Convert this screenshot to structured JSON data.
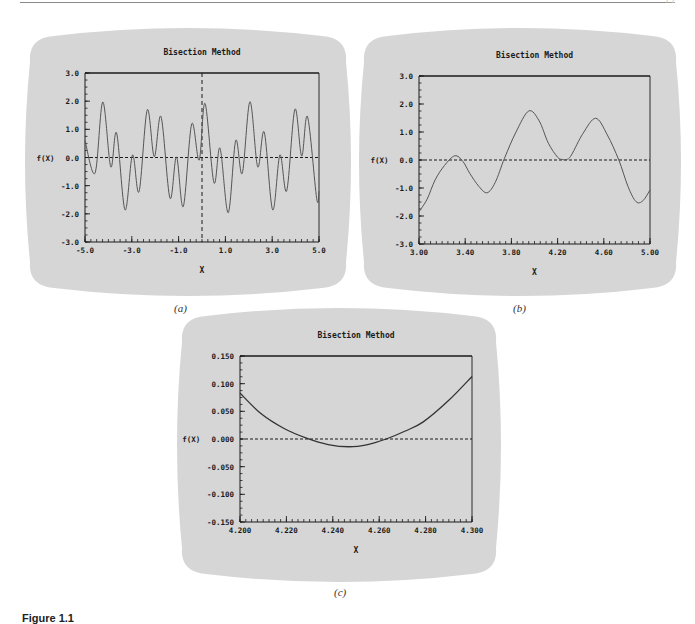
{
  "page": {
    "page_number": "1.2",
    "figure_caption": "Figure 1.1",
    "panel_labels": [
      "(a)",
      "(b)",
      "(c)"
    ]
  },
  "chart_data": [
    {
      "id": "a",
      "type": "line",
      "title": "Bisection Method",
      "xlabel": "X",
      "ylabel": "f(X)",
      "xlim": [
        -5.0,
        5.0
      ],
      "ylim": [
        -3.0,
        3.0
      ],
      "xticks": [
        -5.0,
        -3.0,
        -1.0,
        1.0,
        3.0,
        5.0
      ],
      "xtick_labels": [
        "-5.0",
        "-3.0",
        "-1.0",
        "1.0",
        "3.0",
        "5.0"
      ],
      "yticks": [
        3.0,
        2.0,
        1.0,
        0.0,
        -1.0,
        -2.0,
        -3.0
      ],
      "ytick_labels": [
        "3.0",
        "2.0",
        "1.0",
        "0.0",
        "-1.0",
        "-2.0",
        "-3.0"
      ],
      "minor_x_step": 0.25,
      "minor_y_step": 0.25,
      "grid": false,
      "reference_lines": [
        {
          "orientation": "horizontal",
          "value": 0.0,
          "style": "dashed"
        },
        {
          "orientation": "vertical",
          "value": 0.0,
          "style": "dashed"
        }
      ],
      "series": [
        {
          "name": "f(X)",
          "color": "#555555",
          "x": [
            -5.0,
            -4.57,
            -4.24,
            -3.9,
            -3.65,
            -3.29,
            -2.97,
            -2.69,
            -2.34,
            -2.04,
            -1.75,
            -1.37,
            -1.09,
            -0.8,
            -0.44,
            -0.12,
            0.13,
            0.51,
            0.77,
            1.12,
            1.44,
            1.72,
            2.05,
            2.38,
            2.66,
            3.02,
            3.33,
            3.62,
            3.97,
            4.26,
            4.51,
            4.9,
            5.0
          ],
          "y": [
            0.6,
            -0.55,
            1.97,
            -0.33,
            0.87,
            -1.86,
            0.09,
            -1.21,
            1.69,
            0.03,
            1.45,
            -1.44,
            0.02,
            -1.74,
            1.19,
            -0.09,
            1.92,
            -0.89,
            0.33,
            -1.96,
            0.6,
            -0.56,
            1.98,
            -0.33,
            0.9,
            -1.86,
            0.09,
            -1.18,
            1.71,
            0.05,
            1.45,
            -1.45,
            -1.2
          ]
        }
      ],
      "layout": {
        "screen": [
          28,
          28,
          320,
          268
        ],
        "plot": [
          85,
          73,
          234,
          169
        ]
      }
    },
    {
      "id": "b",
      "type": "line",
      "title": "Bisection Method",
      "xlabel": "X",
      "ylabel": "f(X)",
      "xlim": [
        3.0,
        5.0
      ],
      "ylim": [
        -3.0,
        3.0
      ],
      "xticks": [
        3.0,
        3.4,
        3.8,
        4.2,
        4.6,
        5.0
      ],
      "xtick_labels": [
        "3.00",
        "3.40",
        "3.80",
        "4.20",
        "4.60",
        "5.00"
      ],
      "yticks": [
        3.0,
        2.0,
        1.0,
        0.0,
        -1.0,
        -2.0,
        -3.0
      ],
      "ytick_labels": [
        "3.0",
        "2.0",
        "1.0",
        "0.0",
        "-1.0",
        "-2.0",
        "-3.0"
      ],
      "minor_x_step": 0.05,
      "minor_y_step": 0.25,
      "grid": false,
      "reference_lines": [
        {
          "orientation": "horizontal",
          "value": 0.0,
          "style": "dashed"
        }
      ],
      "series": [
        {
          "name": "f(X)",
          "color": "#555555",
          "x": [
            3.0,
            3.07,
            3.14,
            3.22,
            3.31,
            3.38,
            3.44,
            3.52,
            3.59,
            3.66,
            3.74,
            3.84,
            3.95,
            4.04,
            4.12,
            4.2,
            4.24,
            4.28,
            4.32,
            4.42,
            4.53,
            4.63,
            4.73,
            4.81,
            4.88,
            4.94,
            5.0
          ],
          "y": [
            -1.85,
            -1.4,
            -0.71,
            -0.2,
            0.15,
            -0.05,
            -0.48,
            -0.95,
            -1.17,
            -0.8,
            0.06,
            1.0,
            1.75,
            1.4,
            0.6,
            0.1,
            0.02,
            0.02,
            0.18,
            0.95,
            1.49,
            0.9,
            0.0,
            -0.95,
            -1.49,
            -1.45,
            -1.07
          ]
        }
      ],
      "layout": {
        "screen": [
          362,
          28,
          316,
          268
        ],
        "plot": [
          419,
          76,
          231,
          168
        ]
      }
    },
    {
      "id": "c",
      "type": "line",
      "title": "Bisection Method",
      "xlabel": "X",
      "ylabel": "f(X)",
      "xlim": [
        4.2,
        4.3
      ],
      "ylim": [
        -0.15,
        0.15
      ],
      "xticks": [
        4.2,
        4.22,
        4.24,
        4.26,
        4.28,
        4.3
      ],
      "xtick_labels": [
        "4.200",
        "4.220",
        "4.240",
        "4.260",
        "4.280",
        "4.300"
      ],
      "yticks": [
        0.15,
        0.1,
        0.05,
        0.0,
        -0.05,
        -0.1,
        -0.15
      ],
      "ytick_labels": [
        "0.150",
        "0.100",
        "0.050",
        "0.000",
        "-0.050",
        "-0.100",
        "-0.150"
      ],
      "minor_x_step": 0.0025,
      "minor_y_step": 0.0125,
      "grid": false,
      "reference_lines": [
        {
          "orientation": "horizontal",
          "value": 0.0,
          "style": "dashed"
        }
      ],
      "series": [
        {
          "name": "f(X)",
          "color": "#333333",
          "x": [
            4.2,
            4.209,
            4.219,
            4.229,
            4.238,
            4.247,
            4.255,
            4.263,
            4.271,
            4.279,
            4.29,
            4.3
          ],
          "y": [
            0.083,
            0.046,
            0.019,
            0.001,
            -0.01,
            -0.014,
            -0.01,
            0.0,
            0.014,
            0.031,
            0.07,
            0.113
          ]
        }
      ],
      "layout": {
        "screen": [
          180,
          308,
          318,
          274
        ],
        "plot": [
          240,
          356,
          232,
          166
        ]
      }
    }
  ],
  "colors": {
    "screen_bg": "#d6d6d6",
    "axis": "#1a1a1a",
    "text": "#1a1a1a",
    "page_bg": "#ffffff"
  }
}
